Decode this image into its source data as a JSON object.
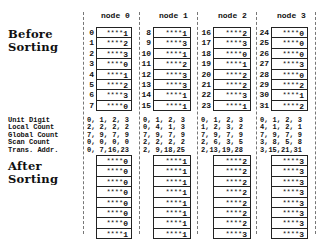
{
  "titles": {
    "before": [
      "Before",
      "Sorting"
    ],
    "after": [
      "After",
      "Sorting"
    ]
  },
  "nodes": [
    {
      "header": "node 0",
      "indices": [
        "0",
        "1",
        "2",
        "3",
        "4",
        "5",
        "6",
        "7"
      ],
      "before": [
        "1",
        "2",
        "3",
        "0",
        "1",
        "2",
        "3",
        "0"
      ],
      "after": [
        "0",
        "0",
        "0",
        "0",
        "0",
        "0",
        "0",
        "1"
      ],
      "stats": [
        "0, 1, 2, 3",
        "2, 2, 2, 2",
        "7, 9, 7, 9",
        "0, 0, 0, 0",
        "0, 7,16,23"
      ]
    },
    {
      "header": "node 1",
      "indices": [
        "8",
        "9",
        "10",
        "11",
        "12",
        "13",
        "14",
        "15"
      ],
      "before": [
        "1",
        "3",
        "1",
        "2",
        "3",
        "3",
        "1",
        "1"
      ],
      "after": [
        "1",
        "1",
        "1",
        "1",
        "1",
        "1",
        "1",
        "1"
      ],
      "stats": [
        "0, 1, 2, 3",
        "0, 4, 1, 3",
        "7, 9, 7, 9",
        "2, 2, 2, 2",
        "2, 9,18,25"
      ]
    },
    {
      "header": "node 2",
      "indices": [
        "16",
        "17",
        "18",
        "19",
        "20",
        "21",
        "22",
        "23"
      ],
      "before": [
        "2",
        "3",
        "0",
        "1",
        "2",
        "2",
        "3",
        "1"
      ],
      "after": [
        "2",
        "2",
        "2",
        "2",
        "2",
        "2",
        "2",
        "3"
      ],
      "stats": [
        "0, 1, 2, 3",
        "1, 2, 3, 2",
        "7, 9, 7, 9",
        "2, 6, 3, 5",
        "2,13,19,28"
      ]
    },
    {
      "header": "node 3",
      "indices": [
        "24",
        "25",
        "26",
        "27",
        "28",
        "29",
        "30",
        "31"
      ],
      "before": [
        "0",
        "0",
        "0",
        "3",
        "0",
        "2",
        "1",
        "2"
      ],
      "after": [
        "3",
        "3",
        "3",
        "3",
        "3",
        "3",
        "3",
        "3"
      ],
      "stats": [
        "0, 1, 2, 3",
        "4, 1, 2, 1",
        "7, 9, 7, 9",
        "3, 8, 5, 8",
        "3,15,21,31"
      ]
    }
  ],
  "cell_prefix": "****",
  "stat_labels": [
    "Unit Digit",
    "Local Count",
    "Global Count",
    "Scan Count",
    "Trans. Addr."
  ]
}
